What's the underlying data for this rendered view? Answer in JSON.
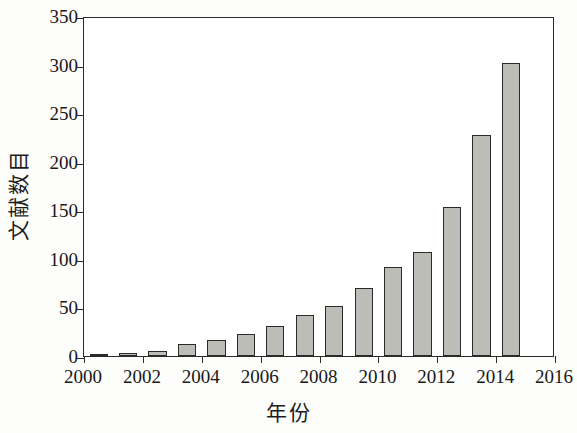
{
  "chart_data": {
    "type": "bar",
    "title": "",
    "subtitle": "",
    "xlabel": "年份",
    "ylabel": "文献数目",
    "categories": [
      "2000",
      "2001",
      "2002",
      "2003",
      "2004",
      "2005",
      "2006",
      "2007",
      "2008",
      "2009",
      "2010",
      "2011",
      "2012",
      "2013",
      "2014",
      "2015"
    ],
    "values": [
      1,
      3,
      5,
      12,
      17,
      23,
      31,
      42,
      51,
      70,
      92,
      107,
      153,
      228,
      302,
      0
    ],
    "series": [
      {
        "name": "文献数目",
        "values": [
          1,
          3,
          5,
          12,
          17,
          23,
          31,
          42,
          51,
          70,
          92,
          107,
          153,
          228,
          302,
          0
        ]
      }
    ],
    "bars": [
      {
        "year": "2000",
        "value": 1
      },
      {
        "year": "2001",
        "value": 3
      },
      {
        "year": "2002",
        "value": 5
      },
      {
        "year": "2003",
        "value": 12
      },
      {
        "year": "2004",
        "value": 17
      },
      {
        "year": "2005",
        "value": 23
      },
      {
        "year": "2006",
        "value": 31
      },
      {
        "year": "2007",
        "value": 42
      },
      {
        "year": "2008",
        "value": 51
      },
      {
        "year": "2009",
        "value": 70
      },
      {
        "year": "2010",
        "value": 92
      },
      {
        "year": "2011",
        "value": 107
      },
      {
        "year": "2012",
        "value": 153
      },
      {
        "year": "2013",
        "value": 228
      },
      {
        "year": "2014",
        "value": 302
      }
    ],
    "ylim": [
      0,
      350
    ],
    "yticks": [
      0,
      50,
      100,
      150,
      200,
      250,
      300,
      350
    ],
    "ytick_labels": [
      "0",
      "50",
      "100",
      "150",
      "200",
      "250",
      "300",
      "350"
    ],
    "xlim": [
      2000,
      2016
    ],
    "xticks": [
      2000,
      2002,
      2004,
      2006,
      2008,
      2010,
      2012,
      2014,
      2016
    ],
    "xtick_labels": [
      "2000",
      "2002",
      "2004",
      "2006",
      "2008",
      "2010",
      "2012",
      "2014",
      "2016"
    ],
    "grid": false,
    "legend": null,
    "legend_position": "none",
    "bar_color": "#bdbdb8",
    "bar_edge_color": "#2a2a2a",
    "axis_color": "#2b2b2b",
    "background_color": "#ffffff"
  }
}
